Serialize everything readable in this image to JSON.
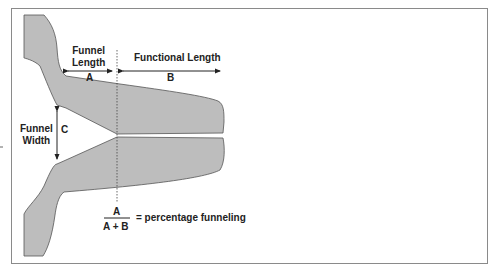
{
  "diagram": {
    "labels": {
      "funnel_length": [
        "Funnel",
        "Length"
      ],
      "functional_length": "Functional Length",
      "a": "A",
      "b": "B",
      "c": "C",
      "funnel_width": [
        "Funnel",
        "Width"
      ]
    },
    "formula": {
      "numerator": "A",
      "denominator": "A + B",
      "result": "= percentage funneling"
    },
    "colors": {
      "shape_fill": "#bdbdbd",
      "shape_stroke": "#555555",
      "frame": "#8a8a8a",
      "text": "#222222"
    }
  }
}
